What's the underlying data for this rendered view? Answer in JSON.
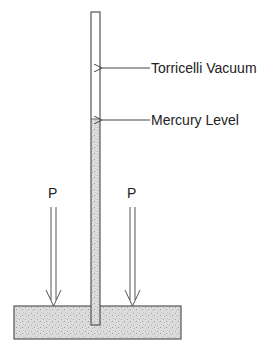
{
  "diagram": {
    "labels": {
      "vacuum": "Torricelli Vacuum",
      "mercury_level": "Mercury Level",
      "pressure_left": "P",
      "pressure_right": "P"
    },
    "colors": {
      "stroke": "#444444",
      "mercury_fill": "#d0d0d0",
      "background": "#ffffff"
    }
  }
}
